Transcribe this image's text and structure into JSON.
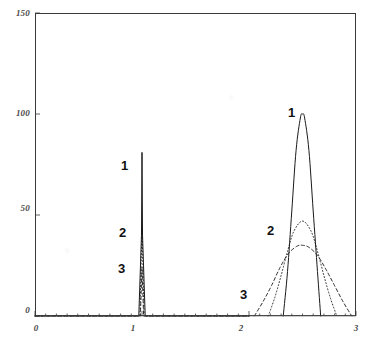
{
  "chart_data": {
    "type": "line",
    "title": "",
    "xlabel": "",
    "ylabel": "",
    "xlim": [
      0,
      3
    ],
    "ylim": [
      0,
      150
    ],
    "grid": false,
    "legend_position": "inline-curve-labels",
    "x_ticks": [
      "0",
      "1",
      "2",
      "3"
    ],
    "y_ticks": [
      "0",
      "50",
      "100",
      "150"
    ],
    "x_tick_values": [
      0,
      1,
      2,
      3
    ],
    "y_tick_values": [
      0,
      50,
      100,
      150
    ],
    "annotations": [
      {
        "text": "1",
        "x": 0.93,
        "y": 74,
        "cluster": "left"
      },
      {
        "text": "2",
        "x": 0.93,
        "y": 41,
        "cluster": "left"
      },
      {
        "text": "3",
        "x": 0.93,
        "y": 22,
        "cluster": "left"
      },
      {
        "text": "1",
        "x": 2.38,
        "y": 95,
        "cluster": "right"
      },
      {
        "text": "2",
        "x": 2.22,
        "y": 42,
        "cluster": "right"
      },
      {
        "text": "3",
        "x": 2.0,
        "y": 12,
        "cluster": "right"
      }
    ],
    "series": [
      {
        "name": "1",
        "style": "solid",
        "peaks": [
          {
            "center": 1.0,
            "height": 81,
            "halfwidth": 0.012
          },
          {
            "center": 2.5,
            "height": 100,
            "halfwidth": 0.085
          }
        ],
        "points_left": [
          {
            "x": 0.0,
            "y": 0
          },
          {
            "x": 0.97,
            "y": 0
          },
          {
            "x": 0.995,
            "y": 40
          },
          {
            "x": 1.0,
            "y": 81
          },
          {
            "x": 1.005,
            "y": 40
          },
          {
            "x": 1.03,
            "y": 0
          },
          {
            "x": 2.0,
            "y": 0
          }
        ],
        "points_right": [
          {
            "x": 2.32,
            "y": 0
          },
          {
            "x": 2.36,
            "y": 22
          },
          {
            "x": 2.4,
            "y": 52
          },
          {
            "x": 2.44,
            "y": 82
          },
          {
            "x": 2.48,
            "y": 98
          },
          {
            "x": 2.5,
            "y": 100
          },
          {
            "x": 2.52,
            "y": 98
          },
          {
            "x": 2.56,
            "y": 82
          },
          {
            "x": 2.6,
            "y": 52
          },
          {
            "x": 2.64,
            "y": 22
          },
          {
            "x": 2.67,
            "y": 0
          }
        ]
      },
      {
        "name": "2",
        "style": "dotted",
        "peaks": [
          {
            "center": 1.0,
            "height": 44,
            "halfwidth": 0.01
          },
          {
            "center": 2.5,
            "height": 47,
            "halfwidth": 0.15
          }
        ],
        "points_left": [
          {
            "x": 0.0,
            "y": 0
          },
          {
            "x": 0.98,
            "y": 0
          },
          {
            "x": 1.0,
            "y": 44
          },
          {
            "x": 1.02,
            "y": 0
          },
          {
            "x": 2.0,
            "y": 0
          }
        ],
        "points_right": [
          {
            "x": 2.18,
            "y": 0
          },
          {
            "x": 2.24,
            "y": 9
          },
          {
            "x": 2.3,
            "y": 20
          },
          {
            "x": 2.36,
            "y": 32
          },
          {
            "x": 2.42,
            "y": 42
          },
          {
            "x": 2.5,
            "y": 47
          },
          {
            "x": 2.58,
            "y": 42
          },
          {
            "x": 2.64,
            "y": 32
          },
          {
            "x": 2.7,
            "y": 20
          },
          {
            "x": 2.76,
            "y": 9
          },
          {
            "x": 2.82,
            "y": 0
          }
        ]
      },
      {
        "name": "3",
        "style": "dashed",
        "peaks": [
          {
            "center": 1.0,
            "height": 24,
            "halfwidth": 0.009
          },
          {
            "center": 2.5,
            "height": 35,
            "halfwidth": 0.215
          }
        ],
        "points_left": [
          {
            "x": 0.0,
            "y": 0
          },
          {
            "x": 0.985,
            "y": 0
          },
          {
            "x": 1.0,
            "y": 24
          },
          {
            "x": 1.015,
            "y": 0
          },
          {
            "x": 2.0,
            "y": 0
          }
        ],
        "points_right": [
          {
            "x": 2.05,
            "y": 0
          },
          {
            "x": 2.13,
            "y": 7
          },
          {
            "x": 2.21,
            "y": 15
          },
          {
            "x": 2.29,
            "y": 24
          },
          {
            "x": 2.37,
            "y": 31
          },
          {
            "x": 2.45,
            "y": 34.6
          },
          {
            "x": 2.5,
            "y": 35
          },
          {
            "x": 2.56,
            "y": 34
          },
          {
            "x": 2.64,
            "y": 30
          },
          {
            "x": 2.72,
            "y": 23
          },
          {
            "x": 2.8,
            "y": 15
          },
          {
            "x": 2.88,
            "y": 7
          },
          {
            "x": 2.96,
            "y": 0
          }
        ]
      }
    ],
    "colors": {
      "axis": "#3a3a3a",
      "curve": "#1a1a1a",
      "tick_label": "#4a4a4a",
      "background": "#ffffff"
    }
  }
}
